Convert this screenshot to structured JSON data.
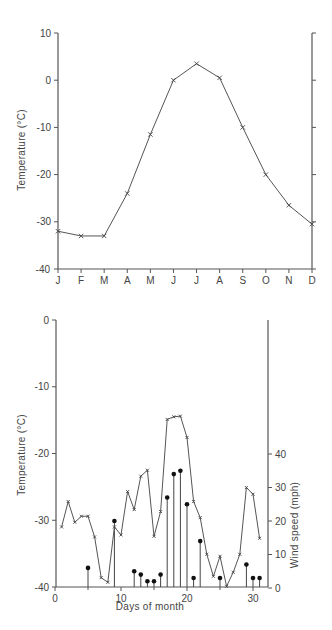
{
  "chart_data": [
    {
      "type": "line",
      "title": "",
      "xlabel": "",
      "ylabel": "Temperature  (°C)",
      "ylim": [
        -40,
        10
      ],
      "yticks": [
        10,
        0,
        -10,
        -20,
        -30,
        -40
      ],
      "categories": [
        "J",
        "F",
        "M",
        "A",
        "M",
        "J",
        "J",
        "A",
        "S",
        "O",
        "N",
        "D"
      ],
      "series": [
        {
          "name": "Monthly mean temperature",
          "marker": "x",
          "values": [
            -32,
            -33,
            -33,
            -24,
            -11.5,
            0,
            3.5,
            0.5,
            -10,
            -20,
            -26.5,
            -30.5
          ]
        }
      ],
      "grid": false,
      "right_axis": true,
      "right_axis_labels": false
    },
    {
      "type": "line",
      "title": "",
      "xlabel": "Days  of  month",
      "ylabel": "Temperature  (°C)",
      "y2label": "Wind  speed  (mph)",
      "ylim": [
        -40,
        0
      ],
      "yticks": [
        0,
        -10,
        -20,
        -30,
        -40
      ],
      "y2lim": [
        0,
        40
      ],
      "y2ticks": [
        0,
        10,
        20,
        30,
        40
      ],
      "xlim": [
        0,
        32
      ],
      "xticks": [
        0,
        10,
        20,
        30
      ],
      "x": [
        1,
        2,
        3,
        4,
        5,
        6,
        7,
        8,
        9,
        10,
        11,
        12,
        13,
        14,
        15,
        16,
        17,
        18,
        19,
        20,
        21,
        22,
        23,
        24,
        25,
        26,
        27,
        28,
        29,
        30,
        31
      ],
      "series": [
        {
          "name": "Daily temperature",
          "axis": "left",
          "style": "line-x-markers",
          "values": [
            -31,
            -27.2,
            -30.3,
            -29.4,
            -29.4,
            -32.5,
            -38.6,
            -39.3,
            -31,
            -32.2,
            -25.7,
            -28.4,
            -23.4,
            -22.5,
            -32.4,
            -28.7,
            -14.9,
            -14.5,
            -14.4,
            -17.6,
            -27.2,
            -29.6,
            -35.1,
            -38.4,
            -35.4,
            -39.9,
            -37.8,
            -35.1,
            -25.1,
            -26.1,
            -32.7
          ]
        },
        {
          "name": "Wind speed",
          "axis": "right",
          "style": "stem-dots",
          "points": [
            {
              "day": 5,
              "value": 6
            },
            {
              "day": 9,
              "value": 20
            },
            {
              "day": 12,
              "value": 5
            },
            {
              "day": 13,
              "value": 4
            },
            {
              "day": 14,
              "value": 2
            },
            {
              "day": 15,
              "value": 2
            },
            {
              "day": 16,
              "value": 4
            },
            {
              "day": 17,
              "value": 27
            },
            {
              "day": 18,
              "value": 34
            },
            {
              "day": 19,
              "value": 35
            },
            {
              "day": 20,
              "value": 25
            },
            {
              "day": 21,
              "value": 3
            },
            {
              "day": 22,
              "value": 14
            },
            {
              "day": 25,
              "value": 3
            },
            {
              "day": 29,
              "value": 7
            },
            {
              "day": 30,
              "value": 3
            },
            {
              "day": 31,
              "value": 3
            }
          ]
        }
      ],
      "grid": false
    }
  ]
}
